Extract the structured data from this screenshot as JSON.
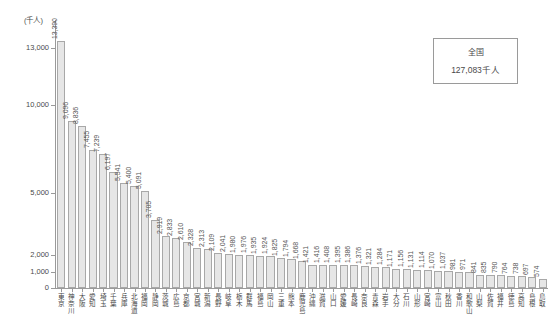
{
  "chart_data": {
    "type": "bar",
    "title": "",
    "subtitle": "",
    "xlabel": "",
    "ylabel": "",
    "unit_caption": "(千人)",
    "grid": false,
    "legend_position": "top-right",
    "ylim": [
      0,
      14000
    ],
    "yticks": [
      0,
      1000,
      2000,
      5000,
      10000,
      13000
    ],
    "ytick_labels": [
      "0",
      "1,000",
      "2,000",
      "5,000",
      "10,000",
      "13,000"
    ],
    "axis_scale_note": "non-linear piecewise axis",
    "categories": [
      "東京",
      "神奈川",
      "大阪",
      "愛知",
      "埼玉",
      "千葉",
      "兵庫",
      "北海道",
      "福岡",
      "静岡",
      "茨城",
      "広島",
      "京都",
      "宮城",
      "新潟",
      "長野",
      "岐阜",
      "栃木",
      "群馬",
      "福島",
      "岡山",
      "三重",
      "熊本",
      "鹿児島",
      "沖縄",
      "滋賀",
      "山口",
      "愛媛",
      "長崎",
      "奈良",
      "青森",
      "岩手",
      "大分",
      "石川",
      "山形",
      "宮崎",
      "富山",
      "秋田",
      "香川",
      "和歌山",
      "山梨",
      "佐賀",
      "福井",
      "徳島",
      "高知",
      "島根",
      "鳥取"
    ],
    "values": [
      13390,
      9096,
      8836,
      7455,
      7239,
      6197,
      5541,
      5400,
      5091,
      3705,
      2919,
      2833,
      2610,
      2328,
      2313,
      2109,
      2041,
      1980,
      1976,
      1935,
      1924,
      1825,
      1794,
      1668,
      1421,
      1416,
      1408,
      1395,
      1386,
      1376,
      1321,
      1284,
      1171,
      1156,
      1131,
      1114,
      1070,
      1037,
      981,
      971,
      841,
      835,
      790,
      764,
      738,
      697,
      574
    ],
    "value_labels": [
      "13,390",
      "9,096",
      "8,836",
      "7,455",
      "7,239",
      "6,197",
      "5,541",
      "5,400",
      "5,091",
      "3,705",
      "2,919",
      "2,833",
      "2,610",
      "2,328",
      "2,313",
      "2,109",
      "2,041",
      "1,980",
      "1,976",
      "1,935",
      "1,924",
      "1,825",
      "1,794",
      "1,668",
      "1,421",
      "1,416",
      "1,408",
      "1,395",
      "1,386",
      "1,376",
      "1,321",
      "1,284",
      "1,171",
      "1,156",
      "1,131",
      "1,114",
      "1,070",
      "1,037",
      "981",
      "971",
      "841",
      "835",
      "790",
      "764",
      "738",
      "697",
      "574"
    ],
    "annotations": {
      "national_total_label": "全国",
      "national_total_value": "127,083千人"
    },
    "colors": {
      "bar_fill": "#e6e6e6",
      "bar_stroke": "#a8a8a8",
      "axis": "#9a9a9a",
      "text": "#4a4a4a"
    }
  }
}
